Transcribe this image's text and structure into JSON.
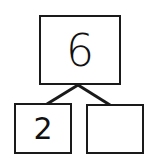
{
  "number_bond": {
    "whole": "6",
    "parts": [
      {
        "value": "2"
      },
      {
        "value": ""
      }
    ]
  },
  "colors": {
    "stroke": "#1a1a1a",
    "background": "#ffffff",
    "text": "#111111"
  }
}
